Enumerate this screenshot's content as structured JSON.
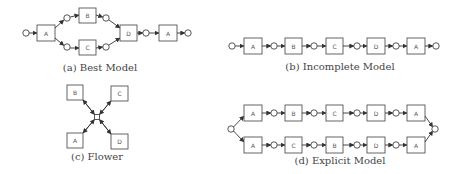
{
  "figures": {
    "best": {
      "caption": "(a) Best Model",
      "transitions": [
        "A",
        "B",
        "C",
        "D",
        "A"
      ]
    },
    "incomplete": {
      "caption": "(b) Incomplete Model",
      "transitions": [
        "A",
        "B",
        "C",
        "D",
        "A"
      ]
    },
    "flower": {
      "caption": "(c) Flower",
      "transitions": [
        "B",
        "C",
        "A",
        "D"
      ]
    },
    "explicit": {
      "caption": "(d) Explicit Model",
      "upper_row": [
        "A",
        "B",
        "C",
        "D",
        "A"
      ],
      "lower_row": [
        "A",
        "C",
        "B",
        "D",
        "A"
      ]
    }
  },
  "colors": {
    "stroke": "#555555",
    "text": "#444444",
    "background": "#ffffff"
  }
}
